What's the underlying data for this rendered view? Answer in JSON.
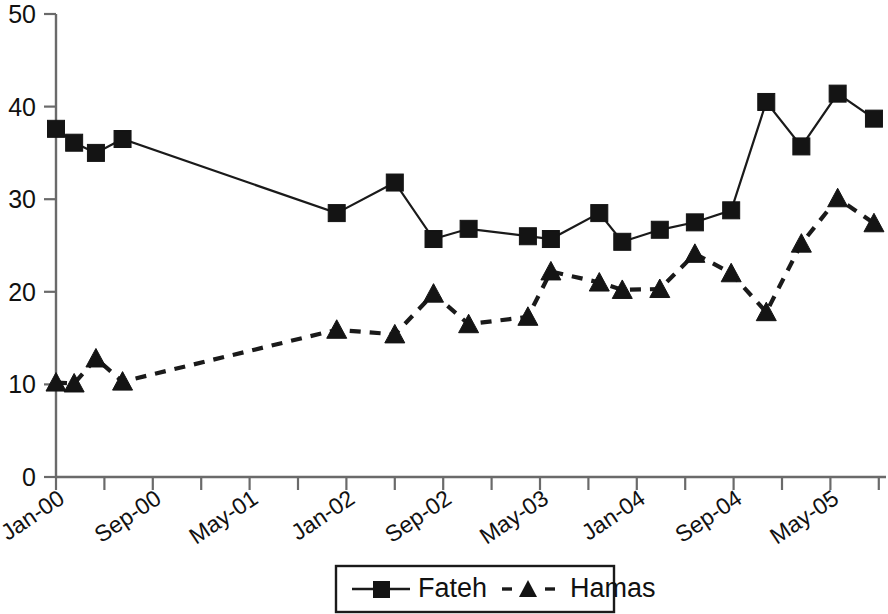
{
  "chart_data": {
    "type": "line",
    "title": "",
    "subtitle": "",
    "xlabel": "",
    "ylabel": "",
    "ylim": [
      0,
      50
    ],
    "y_ticks": [
      0,
      10,
      20,
      30,
      40,
      50
    ],
    "x_tick_labels": [
      "Jan-00",
      "Sep-00",
      "May-01",
      "Jan-02",
      "Sep-02",
      "May-03",
      "Jan-04",
      "Sep-04",
      "May-05"
    ],
    "x_tick_months": [
      0,
      8,
      16,
      24,
      32,
      40,
      48,
      56,
      64
    ],
    "grid": false,
    "legend_position": "bottom",
    "x_unit": "months since Jan-00",
    "x": [
      0,
      1.5,
      3.3,
      5.5,
      23.2,
      28.0,
      31.2,
      34.1,
      39.0,
      40.9,
      44.9,
      46.8,
      49.9,
      52.8,
      55.8,
      58.7,
      61.6,
      64.6,
      67.6,
      70.5
    ],
    "series": [
      {
        "name": "Fateh",
        "marker": "square",
        "line_style": "solid",
        "color": "#141414",
        "values": [
          37.6,
          36.1,
          35.0,
          36.5,
          28.5,
          31.8,
          25.7,
          26.8,
          26.0,
          25.7,
          28.5,
          25.4,
          26.7,
          27.5,
          28.8,
          40.5,
          35.7,
          41.4,
          38.7,
          null
        ]
      },
      {
        "name": "Hamas",
        "marker": "triangle",
        "line_style": "dashed",
        "color": "#141414",
        "values": [
          10.2,
          10.1,
          12.8,
          10.3,
          15.9,
          15.4,
          19.8,
          16.5,
          17.3,
          22.2,
          21.0,
          20.2,
          20.3,
          24.1,
          22.0,
          17.8,
          25.2,
          30.1,
          27.4,
          null
        ]
      }
    ]
  },
  "legend": {
    "items": [
      {
        "label": "Fateh",
        "marker": "square",
        "style": "solid"
      },
      {
        "label": "Hamas",
        "marker": "triangle",
        "style": "dashed"
      }
    ]
  },
  "axes": {
    "y_tick_labels": [
      "50",
      "40",
      "30",
      "20",
      "10",
      "0"
    ],
    "x_tick_labels": [
      "Jan-00",
      "Sep-00",
      "May-01",
      "Jan-02",
      "Sep-02",
      "May-03",
      "Jan-04",
      "Sep-04",
      "May-05"
    ]
  }
}
